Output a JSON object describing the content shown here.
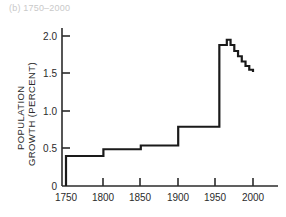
{
  "panel": {
    "label": "(b) 1750–2000"
  },
  "chart_data": {
    "type": "line",
    "title": "(b) 1750–2000",
    "xlabel": "",
    "ylabel": "POPULATION GROWTH (PERCENT)",
    "ylabel_lines": [
      "POPULATION",
      "GROWTH (PERCENT)"
    ],
    "xlim": [
      1735,
      2015
    ],
    "ylim": [
      0,
      2.12
    ],
    "xticks": [
      1750,
      1800,
      1850,
      1900,
      1950,
      2000
    ],
    "xticklabels": [
      "1750",
      "1800",
      "1850",
      "1900",
      "1950",
      "2000"
    ],
    "yticks": [
      0,
      0.5,
      1.0,
      1.5,
      2.0
    ],
    "yticklabels": [
      "0",
      "0.5",
      "1.0",
      "1.5",
      "2.0"
    ],
    "grid": false,
    "legend": false,
    "line_color": "#1a1a1a",
    "line_width": 2.2,
    "step_mode": "post",
    "x": [
      1750,
      1800,
      1850,
      1900,
      1950,
      1955,
      1960,
      1965,
      1970,
      1975,
      1980,
      1985,
      1990,
      1995,
      2000
    ],
    "values": [
      0.4,
      0.49,
      0.54,
      0.79,
      0.79,
      1.88,
      1.88,
      1.95,
      1.88,
      1.8,
      1.73,
      1.66,
      1.6,
      1.55,
      1.52
    ],
    "annotations": [
      {
        "text": "flat 50-year steps 1750-1950",
        "visible": false
      },
      {
        "text": "peak approx 1.95 percent near 1965",
        "visible": false
      }
    ]
  }
}
